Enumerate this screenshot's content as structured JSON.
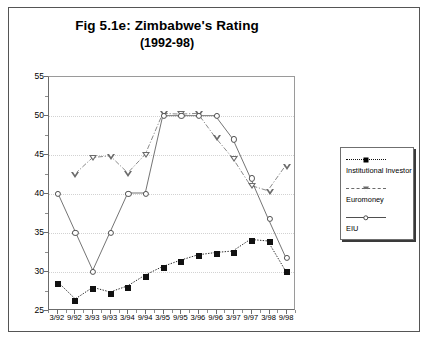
{
  "figure": {
    "title": "Fig 5.1e: Zimbabwe's Rating",
    "subtitle": "(1992-98)"
  },
  "legend": {
    "entries": [
      {
        "label": "Institutional Investor",
        "marker": "filled-square-marker",
        "line": "dotted"
      },
      {
        "label": "Euromoney",
        "marker": "down-triangle-marker",
        "line": "dash-dot"
      },
      {
        "label": "EIU",
        "marker": "open-circle-marker",
        "line": "solid"
      }
    ]
  },
  "chart_data": {
    "type": "line",
    "title": "Fig 5.1e: Zimbabwe's Rating (1992-98)",
    "xlabel": "",
    "ylabel": "",
    "ylim": [
      25,
      55
    ],
    "ytick_step": 5,
    "yticks": [
      25,
      30,
      35,
      40,
      45,
      50,
      55
    ],
    "grid": true,
    "legend_position": "right",
    "categories": [
      "3/92",
      "9/92",
      "3/93",
      "9/93",
      "3/94",
      "9/94",
      "3/95",
      "9/95",
      "3/96",
      "9/96",
      "3/97",
      "9/97",
      "3/98",
      "9/98"
    ],
    "series": [
      {
        "name": "Institutional Investor",
        "marker": "filled-square",
        "linestyle": "dotted",
        "color": "#111111",
        "values": [
          28.5,
          26.3,
          27.8,
          27.2,
          28.0,
          29.4,
          30.5,
          31.3,
          32.0,
          32.3,
          32.5,
          34.0,
          33.8,
          30.0
        ]
      },
      {
        "name": "Euromoney",
        "marker": "down-triangle",
        "linestyle": "dash-dot",
        "color": "#6b6b6b",
        "values": [
          null,
          42.5,
          44.6,
          44.8,
          42.6,
          45.0,
          50.3,
          50.2,
          50.3,
          47.2,
          44.5,
          41.0,
          40.3,
          43.5
        ]
      },
      {
        "name": "EIU",
        "marker": "open-circle",
        "linestyle": "solid",
        "color": "#4f4f4f",
        "values": [
          40.0,
          35.0,
          30.0,
          35.0,
          40.0,
          40.0,
          50.0,
          50.0,
          50.0,
          50.0,
          47.0,
          42.0,
          36.8,
          31.8
        ]
      }
    ]
  }
}
